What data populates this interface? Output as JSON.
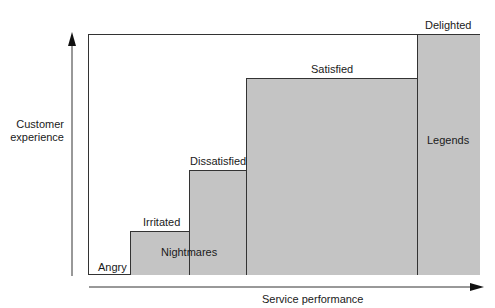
{
  "diagram": {
    "y_axis_label_line1": "Customer",
    "y_axis_label_line2": "experience",
    "x_axis_label": "Service performance",
    "levels": [
      {
        "label": "Angry"
      },
      {
        "label": "Irritated"
      },
      {
        "label": "Dissatisfied"
      },
      {
        "label": "Satisfied"
      },
      {
        "label": "Delighted"
      }
    ],
    "zones": [
      {
        "label": "Nightmares"
      },
      {
        "label": "Legends"
      }
    ],
    "colors": {
      "fill": "#c4c4c4",
      "line": "#333333",
      "background": "#ffffff"
    }
  }
}
